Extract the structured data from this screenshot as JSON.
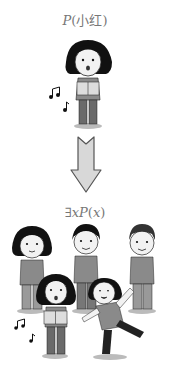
{
  "top_label": {
    "predicate": "P",
    "open": "(",
    "argument": "小红",
    "close": ")"
  },
  "bottom_label": {
    "quantifier": "∃",
    "variable": "x",
    "predicate": "P",
    "open": "(",
    "argument": "x",
    "close": ")"
  },
  "colors": {
    "text": "#777777",
    "hair": "#111111",
    "skin": "#f2f2f2",
    "shirt": "#8a8a8a",
    "pants": "#6a6a6a",
    "arrow_fill": "#d8d8d8",
    "arrow_stroke": "#555555"
  }
}
